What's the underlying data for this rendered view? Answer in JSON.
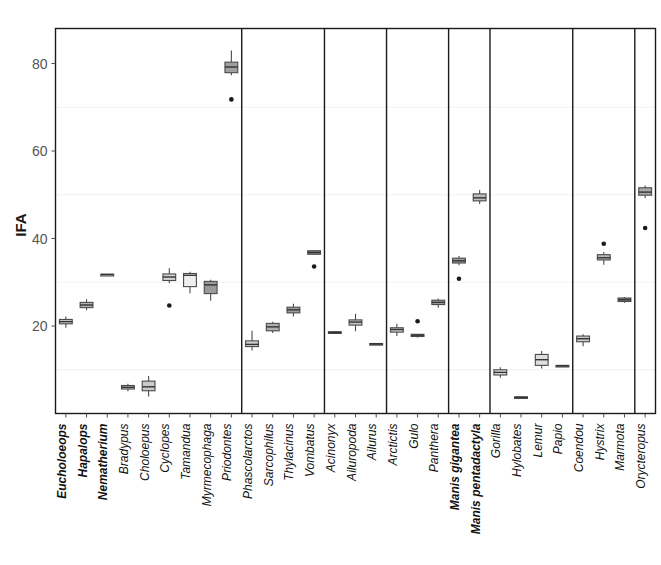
{
  "chart_data": {
    "type": "box",
    "title": "",
    "xlabel": "",
    "ylabel": "IFA",
    "ylim": [
      0,
      88
    ],
    "yticks": [
      20,
      40,
      60,
      80
    ],
    "ytick_labels": [
      "20",
      "40",
      "60",
      "80"
    ],
    "gridlines": [
      10,
      30,
      50,
      70
    ],
    "grid": true,
    "legend": "none",
    "panel_breaks_after": [
      "Priodontes",
      "Vombatus",
      "Ailurus",
      "Panthera",
      "Manis pentadactyla",
      "Papio",
      "Marmota"
    ],
    "categories": [
      "Eucholoeops",
      "Hapalops",
      "Nematherium",
      "Bradypus",
      "Choloepus",
      "Cyclopes",
      "Tamandua",
      "Myrmecophaga",
      "Priodontes",
      "Phascolarctos",
      "Sarcophilus",
      "Thylacinus",
      "Vombatus",
      "Acinonyx",
      "Ailuropoda",
      "Ailurus",
      "Arctictis",
      "Gulo",
      "Panthera",
      "Manis gigantea",
      "Manis pentadactyla",
      "Gorilla",
      "Hylobates",
      "Lemur",
      "Papio",
      "Coendou",
      "Hystrix",
      "Marmota",
      "Orycteropus"
    ],
    "bold_categories": [
      "Eucholoeops",
      "Hapalops",
      "Nematherium",
      "Manis gigantea",
      "Manis pentadactyla"
    ],
    "boxes": [
      {
        "name": "Eucholoeops",
        "lower_whisker": 19.6,
        "q1": 20.5,
        "median": 21.0,
        "q3": 21.5,
        "upper_whisker": 22.2,
        "fill": "#cfcfcf",
        "outliers": []
      },
      {
        "name": "Hapalops",
        "lower_whisker": 23.6,
        "q1": 24.2,
        "median": 24.8,
        "q3": 25.4,
        "upper_whisker": 26.1,
        "fill": "#b3b3b3",
        "outliers": []
      },
      {
        "name": "Nematherium",
        "lower_whisker": 31.8,
        "q1": 31.8,
        "median": 31.8,
        "q3": 31.8,
        "upper_whisker": 31.8,
        "fill": "#d6d6d6",
        "outliers": []
      },
      {
        "name": "Bradypus",
        "lower_whisker": 5.1,
        "q1": 5.6,
        "median": 6.0,
        "q3": 6.4,
        "upper_whisker": 6.8,
        "fill": "#c9c9c9",
        "outliers": []
      },
      {
        "name": "Choloepus",
        "lower_whisker": 3.9,
        "q1": 5.2,
        "median": 6.1,
        "q3": 7.4,
        "upper_whisker": 8.6,
        "fill": "#cacaca",
        "outliers": []
      },
      {
        "name": "Cyclopes",
        "lower_whisker": 29.8,
        "q1": 30.4,
        "median": 31.2,
        "q3": 31.9,
        "upper_whisker": 33.2,
        "fill": "#d2d2d2",
        "outliers": [
          24.7
        ]
      },
      {
        "name": "Tamandua",
        "lower_whisker": 27.5,
        "q1": 29.0,
        "median": 31.6,
        "q3": 32.0,
        "upper_whisker": 32.4,
        "fill": "#eeeeee",
        "outliers": []
      },
      {
        "name": "Myrmecophaga",
        "lower_whisker": 25.8,
        "q1": 27.4,
        "median": 29.4,
        "q3": 30.2,
        "upper_whisker": 30.6,
        "fill": "#9a9a9a",
        "outliers": []
      },
      {
        "name": "Priodontes",
        "lower_whisker": 77.3,
        "q1": 77.9,
        "median": 79.2,
        "q3": 80.3,
        "upper_whisker": 83.0,
        "fill": "#a0a0a0",
        "outliers": [
          71.8
        ]
      },
      {
        "name": "Phascolarctos",
        "lower_whisker": 14.4,
        "q1": 15.3,
        "median": 15.8,
        "q3": 16.6,
        "upper_whisker": 18.9,
        "fill": "#d0d0d0",
        "outliers": []
      },
      {
        "name": "Sarcophilus",
        "lower_whisker": 18.4,
        "q1": 18.9,
        "median": 19.8,
        "q3": 20.6,
        "upper_whisker": 21.0,
        "fill": "#b0b0b0",
        "outliers": []
      },
      {
        "name": "Thylacinus",
        "lower_whisker": 22.2,
        "q1": 23.0,
        "median": 23.7,
        "q3": 24.3,
        "upper_whisker": 25.1,
        "fill": "#9d9d9d",
        "outliers": []
      },
      {
        "name": "Vombatus",
        "lower_whisker": 36.3,
        "q1": 36.4,
        "median": 36.8,
        "q3": 37.2,
        "upper_whisker": 37.3,
        "fill": "#8c8c8c",
        "outliers": [
          33.6
        ]
      },
      {
        "name": "Acinonyx",
        "lower_whisker": 18.2,
        "q1": 18.3,
        "median": 18.5,
        "q3": 18.7,
        "upper_whisker": 18.8,
        "fill": "#8f8f8f",
        "outliers": []
      },
      {
        "name": "Ailuropoda",
        "lower_whisker": 18.8,
        "q1": 20.2,
        "median": 20.9,
        "q3": 21.4,
        "upper_whisker": 22.8,
        "fill": "#c4c4c4",
        "outliers": []
      },
      {
        "name": "Ailurus",
        "lower_whisker": 15.8,
        "q1": 15.8,
        "median": 15.9,
        "q3": 16.0,
        "upper_whisker": 16.0,
        "fill": "#8a8a8a",
        "outliers": []
      },
      {
        "name": "Arctictis",
        "lower_whisker": 17.7,
        "q1": 18.6,
        "median": 19.2,
        "q3": 19.6,
        "upper_whisker": 20.5,
        "fill": "#c7c7c7",
        "outliers": []
      },
      {
        "name": "Gulo",
        "lower_whisker": 17.4,
        "q1": 17.6,
        "median": 17.9,
        "q3": 18.1,
        "upper_whisker": 18.2,
        "fill": "#909090",
        "outliers": [
          21.1
        ]
      },
      {
        "name": "Panthera",
        "lower_whisker": 24.2,
        "q1": 24.9,
        "median": 25.4,
        "q3": 25.9,
        "upper_whisker": 26.3,
        "fill": "#a6a6a6",
        "outliers": []
      },
      {
        "name": "Manis gigantea",
        "lower_whisker": 33.9,
        "q1": 34.4,
        "median": 34.9,
        "q3": 35.5,
        "upper_whisker": 36.0,
        "fill": "#9b9b9b",
        "outliers": [
          30.8
        ]
      },
      {
        "name": "Manis pentadactyla",
        "lower_whisker": 47.9,
        "q1": 48.6,
        "median": 49.3,
        "q3": 50.2,
        "upper_whisker": 51.1,
        "fill": "#bdbdbd",
        "outliers": []
      },
      {
        "name": "Gorilla",
        "lower_whisker": 8.2,
        "q1": 8.8,
        "median": 9.4,
        "q3": 10.0,
        "upper_whisker": 10.6,
        "fill": "#dcdcdc",
        "outliers": []
      },
      {
        "name": "Hylobates",
        "lower_whisker": 3.6,
        "q1": 3.6,
        "median": 3.7,
        "q3": 3.8,
        "upper_whisker": 3.8,
        "fill": "#8d8d8d",
        "outliers": []
      },
      {
        "name": "Lemur",
        "lower_whisker": 10.3,
        "q1": 11.0,
        "median": 12.3,
        "q3": 13.5,
        "upper_whisker": 14.3,
        "fill": "#dddddd",
        "outliers": []
      },
      {
        "name": "Papio",
        "lower_whisker": 10.8,
        "q1": 10.8,
        "median": 10.9,
        "q3": 11.0,
        "upper_whisker": 11.0,
        "fill": "#8b8b8b",
        "outliers": []
      },
      {
        "name": "Coendou",
        "lower_whisker": 15.4,
        "q1": 16.4,
        "median": 17.1,
        "q3": 17.7,
        "upper_whisker": 18.1,
        "fill": "#cbcbcb",
        "outliers": []
      },
      {
        "name": "Hystrix",
        "lower_whisker": 34.0,
        "q1": 35.1,
        "median": 35.6,
        "q3": 36.3,
        "upper_whisker": 36.9,
        "fill": "#b8b8b8",
        "outliers": [
          38.8
        ]
      },
      {
        "name": "Marmota",
        "lower_whisker": 25.3,
        "q1": 25.6,
        "median": 26.0,
        "q3": 26.4,
        "upper_whisker": 26.6,
        "fill": "#8e8e8e",
        "outliers": []
      },
      {
        "name": "Orycteropus",
        "lower_whisker": 49.2,
        "q1": 49.9,
        "median": 50.6,
        "q3": 51.6,
        "upper_whisker": 52.1,
        "fill": "#a9a9a9",
        "outliers": [
          42.4
        ]
      }
    ]
  },
  "colors": {
    "frame": "#1a1a1a",
    "grid": "#f2f0f0",
    "box_stroke": "#4a4a4a",
    "outlier": "#1a1a1a",
    "tick_text": "#555555"
  }
}
